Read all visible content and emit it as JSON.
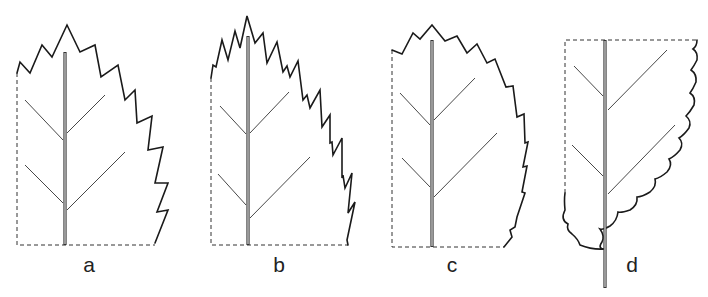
{
  "figure": {
    "line_color": "#1a1a1a",
    "background": "#ffffff"
  },
  "leaves": [
    {
      "id": "a",
      "label": "a",
      "margin_type": "serrate",
      "label_pos": {
        "x": 89,
        "y": 255
      }
    },
    {
      "id": "b",
      "label": "b",
      "margin_type": "doubly-serrate",
      "label_pos": {
        "x": 279,
        "y": 255
      }
    },
    {
      "id": "c",
      "label": "c",
      "margin_type": "serrulate",
      "label_pos": {
        "x": 452,
        "y": 255
      }
    },
    {
      "id": "d",
      "label": "d",
      "margin_type": "crenate",
      "label_pos": {
        "x": 632,
        "y": 255
      }
    }
  ]
}
